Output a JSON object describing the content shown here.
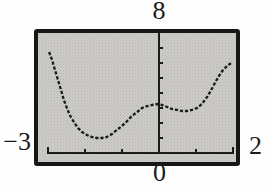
{
  "figure": {
    "type": "graphing-calculator-screen",
    "labels": {
      "ymax": "8",
      "xmin": "−3",
      "xmax": "2",
      "ymin": "0"
    }
  },
  "colors": {
    "ink": "#1b1b1b",
    "frame": "#161616",
    "screen_bg": "#cecdc9",
    "screen_dot": "#b3b2ad",
    "page_bg": "#fefefe"
  },
  "chart_data": {
    "type": "line",
    "title": "",
    "xlabel": "",
    "ylabel": "",
    "legend": null,
    "grid": false,
    "window": {
      "xmin": -3,
      "xmax": 2,
      "ymin": 0,
      "ymax": 8,
      "xscl": 1,
      "yscl": 1
    },
    "curve": {
      "name": "f(x)",
      "style": "dashed-pixel",
      "points": [
        [
          -2.97,
          6.73
        ],
        [
          -2.89,
          6.2
        ],
        [
          -2.81,
          5.53
        ],
        [
          -2.73,
          4.87
        ],
        [
          -2.65,
          4.2
        ],
        [
          -2.57,
          3.53
        ],
        [
          -2.49,
          3.0
        ],
        [
          -2.41,
          2.53
        ],
        [
          -2.3,
          2.07
        ],
        [
          -2.19,
          1.67
        ],
        [
          -2.08,
          1.4
        ],
        [
          -1.95,
          1.2
        ],
        [
          -1.81,
          1.07
        ],
        [
          -1.68,
          1.0
        ],
        [
          -1.54,
          1.0
        ],
        [
          -1.41,
          1.07
        ],
        [
          -1.27,
          1.27
        ],
        [
          -1.14,
          1.53
        ],
        [
          -1.0,
          1.8
        ],
        [
          -0.86,
          2.13
        ],
        [
          -0.73,
          2.47
        ],
        [
          -0.59,
          2.73
        ],
        [
          -0.46,
          3.0
        ],
        [
          -0.32,
          3.13
        ],
        [
          -0.19,
          3.2
        ],
        [
          -0.05,
          3.27
        ],
        [
          0.08,
          3.2
        ],
        [
          0.22,
          3.07
        ],
        [
          0.35,
          2.93
        ],
        [
          0.49,
          2.87
        ],
        [
          0.62,
          2.8
        ],
        [
          0.76,
          2.8
        ],
        [
          0.89,
          2.87
        ],
        [
          1.03,
          3.0
        ],
        [
          1.16,
          3.27
        ],
        [
          1.3,
          3.73
        ],
        [
          1.41,
          4.2
        ],
        [
          1.51,
          4.67
        ],
        [
          1.62,
          5.13
        ],
        [
          1.73,
          5.53
        ],
        [
          1.84,
          5.8
        ],
        [
          1.95,
          6.0
        ]
      ]
    }
  }
}
